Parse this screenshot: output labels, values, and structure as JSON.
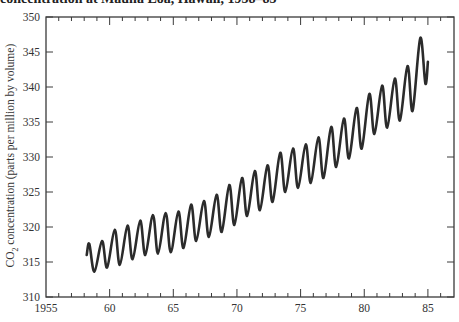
{
  "chart_data": {
    "type": "line",
    "title": "concentration at Mauna Loa, Hawaii, 1958–85",
    "xlabel": "",
    "ylabel": "CO2 concentration (parts per million by volume)",
    "ylabel_parts": {
      "prefix": "CO",
      "sub": "2",
      "suffix": " concentration (parts per million by volume)"
    },
    "xlim": [
      1955,
      1987
    ],
    "ylim": [
      310,
      350
    ],
    "x_ticks": [
      1955,
      1960,
      1965,
      1970,
      1975,
      1980,
      1985
    ],
    "x_tick_labels": [
      "1955",
      "60",
      "65",
      "70",
      "75",
      "80",
      "85"
    ],
    "y_ticks": [
      310,
      315,
      320,
      325,
      330,
      335,
      340,
      345,
      350
    ],
    "y_tick_labels": [
      "310",
      "315",
      "320",
      "325",
      "330",
      "335",
      "340",
      "345",
      "350"
    ],
    "grid": false,
    "legend": null,
    "series": [
      {
        "name": "CO2 concentration",
        "color": "#2b2b2b",
        "x": [
          1958.2,
          1958.4,
          1958.8,
          1959.4,
          1959.8,
          1960.4,
          1960.8,
          1961.4,
          1961.8,
          1962.4,
          1962.8,
          1963.4,
          1963.8,
          1964.4,
          1964.8,
          1965.4,
          1965.8,
          1966.4,
          1966.8,
          1967.4,
          1967.8,
          1968.4,
          1968.8,
          1969.4,
          1969.8,
          1970.4,
          1970.8,
          1971.4,
          1971.8,
          1972.4,
          1972.8,
          1973.4,
          1973.8,
          1974.4,
          1974.8,
          1975.4,
          1975.8,
          1976.4,
          1976.8,
          1977.4,
          1977.8,
          1978.4,
          1978.8,
          1979.4,
          1979.8,
          1980.4,
          1980.8,
          1981.4,
          1981.8,
          1982.4,
          1982.8,
          1983.4,
          1983.8,
          1984.4,
          1984.8,
          1985.0
        ],
        "y": [
          316.0,
          317.6,
          313.6,
          318.0,
          314.2,
          319.6,
          314.6,
          320.2,
          315.4,
          320.9,
          316.0,
          321.7,
          316.2,
          322.0,
          316.4,
          322.2,
          317.0,
          323.2,
          318.0,
          323.7,
          318.6,
          324.6,
          319.3,
          326.0,
          320.3,
          327.0,
          321.6,
          328.0,
          322.4,
          328.8,
          323.6,
          330.6,
          325.0,
          331.2,
          325.6,
          331.8,
          326.3,
          332.8,
          327.0,
          334.3,
          328.6,
          335.5,
          329.8,
          337.0,
          331.2,
          339.0,
          333.3,
          340.2,
          334.2,
          341.2,
          335.2,
          343.0,
          336.6,
          347.0,
          340.5,
          343.6
        ]
      }
    ]
  }
}
